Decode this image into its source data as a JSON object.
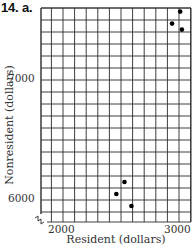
{
  "title": "14. a.",
  "chart_data": {
    "type": "scatter",
    "title": "14. a.",
    "xlabel": "Resident (dollars)",
    "ylabel": "Nonresident (dollars)",
    "xlim": [
      1800,
      3100
    ],
    "ylim": [
      5820,
      7600
    ],
    "x_grid_step": 100,
    "y_grid_step": 100,
    "grid": true,
    "axis_break": true,
    "x_ticks": [
      2000,
      3000
    ],
    "x_tick_labels": [
      "2000",
      "3000"
    ],
    "y_ticks": [
      6000,
      7000
    ],
    "y_tick_labels": [
      "6000",
      "7000"
    ],
    "series": [
      {
        "name": "points",
        "points": [
          {
            "x": 2460,
            "y": 6050
          },
          {
            "x": 2530,
            "y": 6150
          },
          {
            "x": 2590,
            "y": 5950
          },
          {
            "x": 2940,
            "y": 7470
          },
          {
            "x": 3010,
            "y": 7570
          },
          {
            "x": 3025,
            "y": 7420
          }
        ]
      }
    ],
    "colors": {
      "grid": "#2a2a2a",
      "point": "#000000",
      "text": "#333333"
    }
  }
}
